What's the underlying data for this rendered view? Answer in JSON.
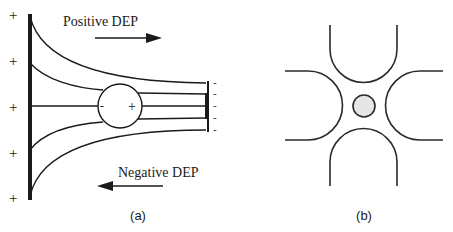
{
  "panel_a": {
    "caption": "(a)",
    "positive_label": "Positive DEP",
    "negative_label": "Negative DEP",
    "left_electrode_charges": [
      "+",
      "+",
      "+",
      "+",
      "+"
    ],
    "right_electrode_charges": [
      "-",
      "-",
      "-",
      "-",
      "-"
    ],
    "particle_charges": {
      "left": "-",
      "right": "+"
    },
    "positive_arrow_direction": "right",
    "negative_arrow_direction": "left"
  },
  "panel_b": {
    "caption": "(b)",
    "electrodes": [
      "top",
      "left",
      "right",
      "bottom"
    ],
    "particle_fill": "#e6e6e6"
  },
  "colors": {
    "line": "#1a1a1a",
    "background": "#ffffff"
  }
}
